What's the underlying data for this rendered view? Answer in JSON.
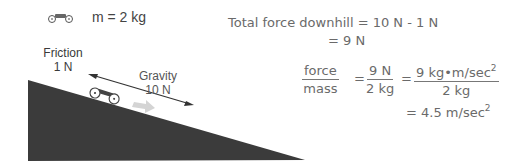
{
  "legend": {
    "icon": "car-icon",
    "mass_label": "m = 2 kg"
  },
  "forces": {
    "friction": {
      "label": "Friction",
      "value": "1 N"
    },
    "gravity": {
      "label": "Gravity",
      "value": "10 N"
    }
  },
  "equations": {
    "total_force_line1": "Total force downhill = 10 N - 1 N",
    "total_force_line2": "= 9 N",
    "ratio": {
      "lhs_num": "force",
      "lhs_den": "mass",
      "eq1": "=",
      "mid_num": "9 N",
      "mid_den": "2 kg",
      "eq2": "=",
      "rhs_num": "9 kg•m/sec",
      "rhs_num_exp": "2",
      "rhs_den": "2 kg"
    },
    "result": "= 4.5 m/sec",
    "result_exp": "2"
  },
  "colors": {
    "ramp": "#3b3b3b",
    "text": "#666666",
    "arrow": "#333333",
    "motion_arrow": "#cfcfcf"
  }
}
